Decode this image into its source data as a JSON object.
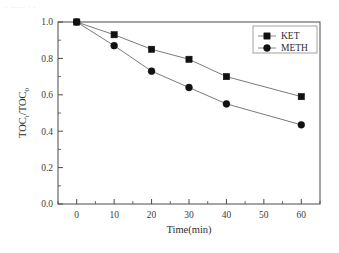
{
  "figure": {
    "background_color": "#ffffff",
    "frame_color": "#4a4a4a",
    "artifact_text": "· ····· · ·"
  },
  "chart_data": {
    "type": "line",
    "title": "",
    "subtitle": "",
    "xlabel": "Time(min)",
    "ylabel": "TOC",
    "ylabel_sub1": "t",
    "ylabel_mid": "/TOC",
    "ylabel_sub2": "0",
    "ylabel_full": "TOCt/TOC0",
    "x": [
      0,
      10,
      20,
      30,
      40,
      60
    ],
    "xlim": [
      -5,
      65
    ],
    "ylim": [
      0.0,
      1.0
    ],
    "xticks": [
      0,
      10,
      20,
      30,
      40,
      50,
      60
    ],
    "xtick_labels": [
      "0",
      "10",
      "20",
      "30",
      "40",
      "50",
      "60"
    ],
    "yticks": [
      0.0,
      0.2,
      0.4,
      0.6,
      0.8,
      1.0
    ],
    "ytick_labels": [
      "0.0",
      "0.2",
      "0.4",
      "0.6",
      "0.8",
      "1.0"
    ],
    "x_minor_step": 5,
    "y_minor_step": 0.1,
    "grid": false,
    "legend_position": "top-right",
    "line_color": "#6b6b6b",
    "marker_color": "#111111",
    "series": [
      {
        "name": "KET",
        "marker": "square",
        "values": [
          1.0,
          0.93,
          0.85,
          0.795,
          0.7,
          0.59
        ]
      },
      {
        "name": "METH",
        "marker": "circle",
        "values": [
          1.0,
          0.87,
          0.73,
          0.64,
          0.55,
          0.435
        ]
      }
    ]
  },
  "legend": {
    "entries": [
      {
        "label": "KET",
        "marker": "square"
      },
      {
        "label": "METH",
        "marker": "circle"
      }
    ]
  }
}
